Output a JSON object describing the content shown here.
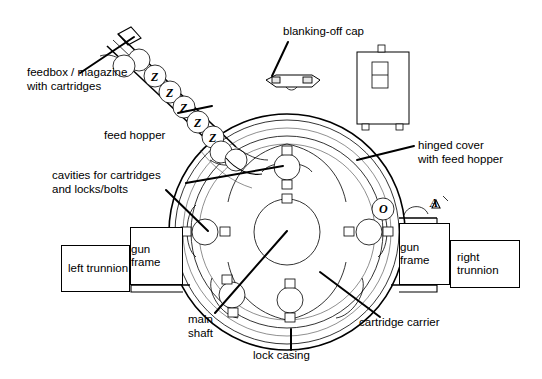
{
  "diagram": {
    "background_color": "#ffffff",
    "line_color": "#000000"
  },
  "labels": {
    "feedbox": "feedbox / magazine\nwith cartridges",
    "feed_hopper": "feed hopper",
    "cavities": "cavities for cartridges\nand locks/bolts",
    "blanking_cap": "blanking-off cap",
    "hinged_cover": "hinged cover\nwith feed hopper",
    "main_shaft": "main\nshaft",
    "lock_casing": "lock casing",
    "cartridge_carrier": "cartridge carrier"
  },
  "callout_boxes": {
    "left_trunnion": "left\ntrunnion",
    "gun_frame_left": "gun\nframe",
    "gun_frame_right": "gun\nframe",
    "right_trunnion": "right\ntrunnion"
  },
  "reference_letters": {
    "o": "O",
    "a": "A"
  },
  "cartridges": {
    "marking": "Z",
    "marked_count": 5,
    "blank_count": 4,
    "total_in_magazine": 9
  },
  "carrier": {
    "cavity_count": 5,
    "hub_label": "main shaft"
  }
}
